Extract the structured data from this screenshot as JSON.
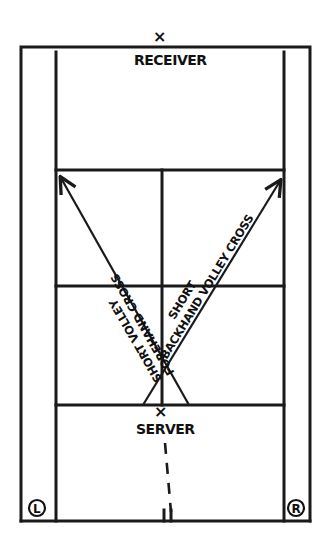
{
  "diagram": {
    "colors": {
      "ink": "#1a1a1a",
      "background": "#ffffff"
    },
    "players": {
      "receiver": {
        "label": "RECEIVER",
        "marker": "×"
      },
      "server": {
        "label": "SERVER",
        "marker": "×"
      }
    },
    "shots": [
      {
        "id": "forehand",
        "line1": "SHORT VOLLEY",
        "line2": "FOREHAND CROSS",
        "direction": "to far left service box corner"
      },
      {
        "id": "backhand",
        "line1": "SHORT",
        "line2": "BACKHAND VOLLEY CROSS",
        "direction": "to far right service box corner"
      }
    ],
    "court_sides": {
      "left": "L",
      "right": "R"
    }
  }
}
